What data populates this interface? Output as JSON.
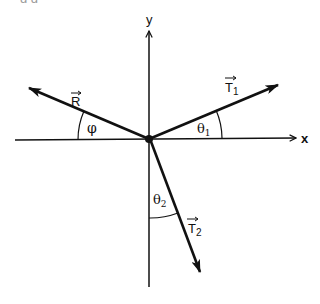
{
  "figure": {
    "type": "force-vector-diagram",
    "caption_fragment": "g        g",
    "axes": {
      "x_label": "x",
      "y_label": "y",
      "origin": [
        149,
        139
      ]
    },
    "vectors": [
      {
        "id": "R",
        "label": "R",
        "subscript": "",
        "tip": [
          28,
          87
        ],
        "angle_label": "φ",
        "angle_ref": "negative x-axis"
      },
      {
        "id": "T1",
        "label": "T",
        "subscript": "1",
        "tip": [
          278,
          85
        ],
        "angle_label": "θ",
        "angle_subscript": "1",
        "angle_ref": "positive x-axis"
      },
      {
        "id": "T2",
        "label": "T",
        "subscript": "2",
        "tip": [
          200,
          272
        ],
        "angle_label": "θ",
        "angle_subscript": "2",
        "angle_ref": "negative y-axis"
      }
    ],
    "colors": {
      "line": "#111111",
      "background": "#ffffff"
    }
  },
  "labels": {
    "x": "x",
    "y": "y",
    "R": "R",
    "T1_main": "T",
    "T1_sub": "1",
    "T2_main": "T",
    "T2_sub": "2",
    "phi": "φ",
    "theta1_main": "θ",
    "theta1_sub": "1",
    "theta2_main": "θ",
    "theta2_sub": "2"
  }
}
